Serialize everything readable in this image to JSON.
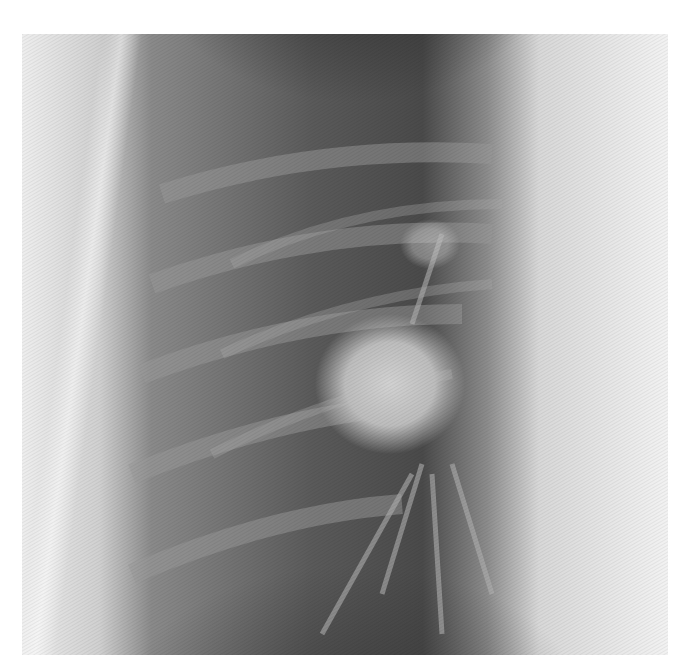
{
  "image": {
    "description": "Lateral chest radiograph detail showing a rounded opacity (mass) projecting over the mid lung, with ribs and hilar vasculature",
    "alt": "Chest X-ray detail with rounded mass"
  },
  "colors": {
    "background": "#ffffff",
    "soft_tissue_light": "#e6e6e6",
    "lung_dark": "#3c3c3c",
    "lung_mid": "#6e6e6e",
    "mass": "#c8c8c8"
  }
}
